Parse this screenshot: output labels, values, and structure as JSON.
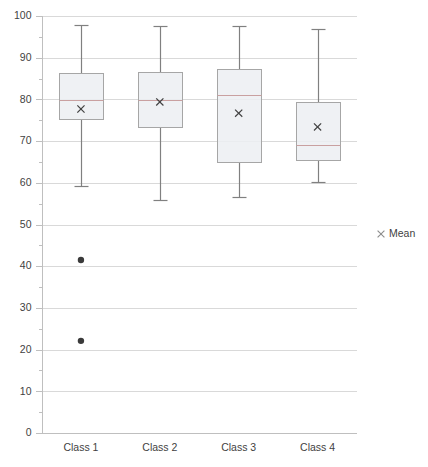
{
  "chart_data": {
    "type": "box",
    "title": "",
    "xlabel": "",
    "ylabel": "",
    "ylim": [
      0,
      100
    ],
    "ytick_step": 10,
    "yticks": [
      0,
      10,
      20,
      30,
      40,
      50,
      60,
      70,
      80,
      90,
      100
    ],
    "ytick_labels": [
      "0",
      "10",
      "20",
      "30",
      "40",
      "50",
      "60",
      "70",
      "80",
      "90",
      "100"
    ],
    "minor_tick_step": 5,
    "grid": true,
    "grid_axis": "y",
    "legend": {
      "position": "right",
      "entries": [
        {
          "label": "Mean",
          "marker": "x",
          "color": "#8c8c8c"
        }
      ]
    },
    "categories": [
      "Class 1",
      "Class 2",
      "Class 3",
      "Class 4"
    ],
    "boxes": [
      {
        "category": "Class 1",
        "whisker_low": 59.2,
        "q1": 75.3,
        "median": 79.9,
        "q3": 86.3,
        "whisker_high": 97.8,
        "mean": 77.7,
        "outliers": [
          41.5,
          22.1
        ]
      },
      {
        "category": "Class 2",
        "whisker_low": 55.9,
        "q1": 73.4,
        "median": 79.9,
        "q3": 86.6,
        "whisker_high": 97.6,
        "mean": 79.4,
        "outliers": []
      },
      {
        "category": "Class 3",
        "whisker_low": 56.6,
        "q1": 65.0,
        "median": 81.1,
        "q3": 87.3,
        "whisker_high": 97.6,
        "mean": 76.7,
        "outliers": []
      },
      {
        "category": "Class 4",
        "whisker_low": 60.2,
        "q1": 65.5,
        "median": 69.1,
        "q3": 79.4,
        "whisker_high": 96.9,
        "mean": 73.4,
        "outliers": []
      }
    ],
    "colors": {
      "box_fill": "#eceff2",
      "box_stroke": "#a6a6a6",
      "median": "#c9a0a0",
      "whisker": "#808080",
      "mean": "#404040",
      "outlier": "#3a3a3a",
      "gridline": "#d9d9d9",
      "axis": "#bfbfbf",
      "text": "#3f3f3f"
    }
  }
}
